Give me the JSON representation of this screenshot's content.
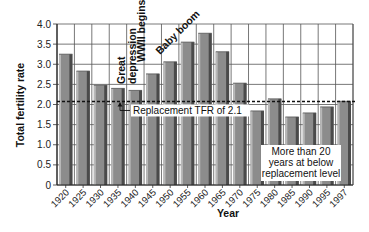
{
  "chart_data": {
    "type": "bar",
    "title": "",
    "xlabel": "Year",
    "ylabel": "Total fertility rate",
    "ylim": [
      0,
      4.0
    ],
    "yticks": [
      "0",
      "0.5",
      "1.0",
      "1.5",
      "2.0",
      "2.5",
      "3.0",
      "3.5",
      "4.0"
    ],
    "grid": true,
    "categories": [
      "1920",
      "1925",
      "1930",
      "1935",
      "1940",
      "1945",
      "1950",
      "1955",
      "1960",
      "1965",
      "1970",
      "1975",
      "1980",
      "1985",
      "1990",
      "1995",
      "1997"
    ],
    "values": [
      3.25,
      2.83,
      2.48,
      2.4,
      2.35,
      2.76,
      3.06,
      3.55,
      3.77,
      3.31,
      2.53,
      1.84,
      2.14,
      1.69,
      1.79,
      1.94,
      2.08
    ],
    "reference_line": {
      "value": 2.1,
      "label": "Replacement TFR of 2.1",
      "style": "dashed"
    },
    "annotations": [
      {
        "text": "Great depression",
        "lines": [
          "Great",
          "depression"
        ],
        "near": "1935"
      },
      {
        "text": "WWII begins",
        "near": "1940"
      },
      {
        "text": "Baby boom",
        "near": "1950-1955"
      },
      {
        "text": "More than 20 years at below replacement level",
        "lines": [
          "More than 20",
          "years at below",
          "replacement level"
        ],
        "near": "1975-1997"
      }
    ],
    "bar_color": "#8c8c8c",
    "bar_shadow_color": "#4a4a4a",
    "legend": "none"
  }
}
